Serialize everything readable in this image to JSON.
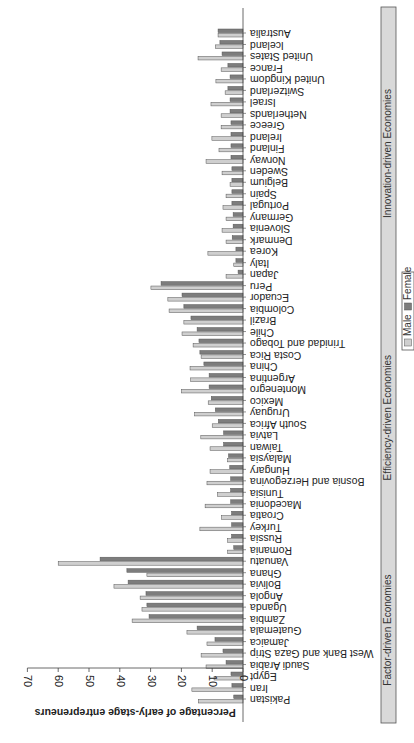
{
  "chart_data": {
    "type": "bar",
    "orientation": "horizontal-bars (image rotated/flipped: value axis runs right-to-left, labels inverted)",
    "title": "",
    "ylabel": "Percentage of early-stage entrepreneurs",
    "xlabel": "",
    "ylim": [
      0,
      70
    ],
    "yticks": [
      0,
      10,
      20,
      30,
      40,
      50,
      60,
      70
    ],
    "grid": false,
    "legend": {
      "position": "bottom",
      "entries": [
        "Male",
        "Female"
      ]
    },
    "colors": {
      "Male": "#cfcfcf",
      "Female": "#7d7d7d",
      "Bar outline": "#555555",
      "Group panel": "#d9d9d9"
    },
    "groups": [
      {
        "name": "Factor-driven Economies",
        "categories": [
          "Pakistan",
          "Iran",
          "Egypt",
          "Saudi Arabia",
          "West Bank and Gaza Strip",
          "Jamaica",
          "Guatemala",
          "Zambia",
          "Uganda",
          "Angola",
          "Bolivia",
          "Ghana",
          "Vanuatu"
        ]
      },
      {
        "name": "Efficiency-driven Economies",
        "categories": [
          "Romania",
          "Russia",
          "Turkey",
          "Croatia",
          "Macedonia",
          "Tunisia",
          "Bosnia and Herzegovina",
          "Hungary",
          "Malaysia",
          "Taiwan",
          "Latvia",
          "South Africa",
          "Uruguay",
          "Mexico",
          "Montenegro",
          "Argentina",
          "China",
          "Costa Rica",
          "Trinidad and Tobago",
          "Chile",
          "Brazil",
          "Colombia",
          "Ecuador",
          "Peru"
        ]
      },
      {
        "name": "Innovation-driven Economies",
        "categories": [
          "Japan",
          "Italy",
          "Korea",
          "Denmark",
          "Slovenia",
          "Germany",
          "Portugal",
          "Spain",
          "Belgium",
          "Sweden",
          "Norway",
          "Finland",
          "Ireland",
          "Greece",
          "Netherlands",
          "Israel",
          "Switzerland",
          "United Kingdom",
          "France",
          "United States",
          "Iceland",
          "Australia"
        ]
      }
    ],
    "categories": [
      "Pakistan",
      "Iran",
      "Egypt",
      "Saudi Arabia",
      "West Bank and Gaza Strip",
      "Jamaica",
      "Guatemala",
      "Zambia",
      "Uganda",
      "Angola",
      "Bolivia",
      "Ghana",
      "Vanuatu",
      "Romania",
      "Russia",
      "Turkey",
      "Croatia",
      "Macedonia",
      "Tunisia",
      "Bosnia and Herzegovina",
      "Hungary",
      "Malaysia",
      "Taiwan",
      "Latvia",
      "South Africa",
      "Uruguay",
      "Mexico",
      "Montenegro",
      "Argentina",
      "China",
      "Costa Rica",
      "Trinidad and Tobago",
      "Chile",
      "Brazil",
      "Colombia",
      "Ecuador",
      "Peru",
      "Japan",
      "Italy",
      "Korea",
      "Denmark",
      "Slovenia",
      "Germany",
      "Portugal",
      "Spain",
      "Belgium",
      "Sweden",
      "Norway",
      "Finland",
      "Ireland",
      "Greece",
      "Netherlands",
      "Israel",
      "Switzerland",
      "United Kingdom",
      "France",
      "United States",
      "Iceland",
      "Australia"
    ],
    "series": [
      {
        "name": "Male",
        "values": [
          14.5,
          16.6,
          9.4,
          12,
          13.6,
          11.7,
          18.2,
          36,
          32.8,
          33.4,
          41.9,
          31.2,
          60,
          5,
          5,
          14,
          7,
          12.3,
          8.3,
          11.7,
          10.7,
          5,
          10.7,
          13.7,
          10,
          15.7,
          11.3,
          20,
          17,
          17.2,
          13.6,
          16.2,
          19.8,
          19.2,
          24,
          24.4,
          29.9,
          5.5,
          3,
          11.4,
          5.5,
          6.8,
          5.5,
          6.5,
          5.5,
          4.2,
          6.8,
          12,
          7.8,
          10.1,
          7.1,
          7.1,
          10.4,
          5.8,
          8.8,
          7.1,
          14.6,
          9,
          8.1
        ]
      },
      {
        "name": "Female",
        "values": [
          3,
          3.6,
          3.9,
          5.5,
          6.5,
          9.1,
          14.9,
          30.5,
          31.2,
          31.5,
          37.3,
          37.7,
          46.4,
          3,
          3.7,
          3.7,
          3.7,
          4,
          4,
          4,
          4.3,
          4.7,
          6.3,
          6.3,
          8,
          9,
          10.3,
          11,
          11,
          12.7,
          14,
          14.3,
          14.9,
          16.9,
          19.2,
          19.8,
          26.6,
          1.6,
          2.3,
          2.3,
          3.5,
          3.2,
          3.2,
          3.6,
          3.6,
          3.6,
          3.6,
          3.9,
          3.9,
          3.9,
          3.9,
          4.2,
          4.2,
          4.9,
          4.2,
          4.9,
          6.8,
          7.5,
          8.1
        ]
      }
    ]
  }
}
